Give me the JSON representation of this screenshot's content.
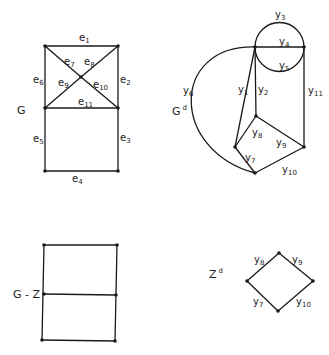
{
  "colors": {
    "ink": "#1a1a1a",
    "background": "#ffffff"
  },
  "graphs": [
    {
      "id": "G",
      "title": {
        "base": "G",
        "sup": "",
        "x": 17,
        "y": 114
      },
      "nodes": [
        {
          "id": "a",
          "x": 45,
          "y": 46
        },
        {
          "id": "b",
          "x": 118,
          "y": 46
        },
        {
          "id": "c",
          "x": 81,
          "y": 77
        },
        {
          "id": "d",
          "x": 45,
          "y": 108
        },
        {
          "id": "e",
          "x": 118,
          "y": 108
        },
        {
          "id": "f",
          "x": 45,
          "y": 171
        },
        {
          "id": "g",
          "x": 118,
          "y": 171
        }
      ],
      "edges": [
        {
          "from": "a",
          "to": "b",
          "label": "e",
          "sub": "1",
          "lx": 79,
          "ly": 41
        },
        {
          "from": "b",
          "to": "e",
          "label": "e",
          "sub": "2",
          "lx": 120,
          "ly": 83
        },
        {
          "from": "e",
          "to": "g",
          "label": "e",
          "sub": "3",
          "lx": 120,
          "ly": 141
        },
        {
          "from": "f",
          "to": "g",
          "label": "e",
          "sub": "4",
          "lx": 72,
          "ly": 182
        },
        {
          "from": "d",
          "to": "f",
          "label": "e",
          "sub": "5",
          "lx": 33,
          "ly": 142
        },
        {
          "from": "a",
          "to": "d",
          "label": "e",
          "sub": "6",
          "lx": 33,
          "ly": 83
        },
        {
          "from": "a",
          "to": "c",
          "label": "e",
          "sub": "7",
          "lx": 64,
          "ly": 65
        },
        {
          "from": "c",
          "to": "b",
          "label": "e",
          "sub": "8",
          "lx": 84,
          "ly": 65
        },
        {
          "from": "d",
          "to": "c",
          "label": "e",
          "sub": "9",
          "lx": 58,
          "ly": 86
        },
        {
          "from": "c",
          "to": "e",
          "label": "e",
          "sub": "10",
          "lx": 93,
          "ly": 88
        },
        {
          "from": "d",
          "to": "e",
          "label": "e",
          "sub": "11",
          "lx": 78,
          "ly": 105
        }
      ]
    },
    {
      "id": "Gd",
      "title": {
        "base": "G",
        "sup": "d",
        "x": 172,
        "y": 115
      },
      "nodes": [
        {
          "id": "p",
          "x": 255,
          "y": 47
        },
        {
          "id": "q",
          "x": 304,
          "y": 47
        },
        {
          "id": "r",
          "x": 256,
          "y": 116
        },
        {
          "id": "s",
          "x": 235,
          "y": 147
        },
        {
          "id": "t",
          "x": 304,
          "y": 147
        },
        {
          "id": "u",
          "x": 255,
          "y": 173
        }
      ],
      "circle": {
        "cx": 279.5,
        "cy": 47,
        "r": 24.5
      },
      "circle_labels": [
        {
          "label": "y",
          "sub": "3",
          "lx": 275,
          "ly": 18
        },
        {
          "label": "y",
          "sub": "5",
          "lx": 279,
          "ly": 69
        }
      ],
      "curve": {
        "path": "M255,47 C170,45 170,150 255,173",
        "label": "y",
        "sub": "6",
        "lx": 183,
        "ly": 94
      },
      "edges": [
        {
          "from": "p",
          "to": "q",
          "label": "y",
          "sub": "4",
          "lx": 279,
          "ly": 45
        },
        {
          "from": "p",
          "to": "s",
          "label": "y",
          "sub": "1",
          "lx": 238,
          "ly": 93
        },
        {
          "from": "p",
          "to": "r",
          "label": "y",
          "sub": "2",
          "lx": 258,
          "ly": 93
        },
        {
          "from": "r",
          "to": "s",
          "label": "y",
          "sub": "8",
          "lx": 252,
          "ly": 136
        },
        {
          "from": "r",
          "to": "t",
          "label": "y",
          "sub": "9",
          "lx": 276,
          "ly": 146
        },
        {
          "from": "s",
          "to": "u",
          "label": "y",
          "sub": "7",
          "lx": 245,
          "ly": 161
        },
        {
          "from": "u",
          "to": "t",
          "label": "y",
          "sub": "10",
          "lx": 282,
          "ly": 173
        },
        {
          "from": "q",
          "to": "t",
          "label": "y",
          "sub": "11",
          "lx": 308,
          "ly": 94
        }
      ]
    },
    {
      "id": "G-Z",
      "title": {
        "base": "G - Z",
        "sup": "",
        "x": 13,
        "y": 298
      },
      "nodes": [
        {
          "id": "a",
          "x": 44,
          "y": 245
        },
        {
          "id": "b",
          "x": 117,
          "y": 245
        },
        {
          "id": "c",
          "x": 44,
          "y": 294
        },
        {
          "id": "d",
          "x": 116,
          "y": 295
        },
        {
          "id": "e",
          "x": 42,
          "y": 340
        },
        {
          "id": "f",
          "x": 115,
          "y": 341
        }
      ],
      "edges": [
        {
          "from": "a",
          "to": "b"
        },
        {
          "from": "a",
          "to": "e"
        },
        {
          "from": "b",
          "to": "f"
        },
        {
          "from": "c",
          "to": "d"
        },
        {
          "from": "e",
          "to": "f"
        }
      ]
    },
    {
      "id": "Zd",
      "title": {
        "base": "Z",
        "sup": "d",
        "x": 209,
        "y": 278
      },
      "nodes": [
        {
          "id": "t",
          "x": 279,
          "y": 253
        },
        {
          "id": "l",
          "x": 247,
          "y": 281
        },
        {
          "id": "r",
          "x": 313,
          "y": 281
        },
        {
          "id": "b",
          "x": 278,
          "y": 311
        }
      ],
      "edges": [
        {
          "from": "l",
          "to": "t",
          "label": "y",
          "sub": "8",
          "lx": 254,
          "ly": 263
        },
        {
          "from": "t",
          "to": "r",
          "label": "y",
          "sub": "9",
          "lx": 292,
          "ly": 263
        },
        {
          "from": "l",
          "to": "b",
          "label": "y",
          "sub": "7",
          "lx": 253,
          "ly": 305
        },
        {
          "from": "b",
          "to": "r",
          "label": "y",
          "sub": "10",
          "lx": 296,
          "ly": 305
        }
      ]
    }
  ]
}
